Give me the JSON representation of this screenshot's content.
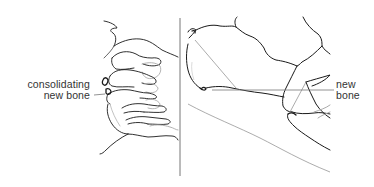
{
  "figure": {
    "panels": [
      {
        "id": "left",
        "description": "cervical spine lateral view sketch",
        "label": {
          "line1": "consolidating",
          "line2": "new bone"
        }
      },
      {
        "id": "right",
        "description": "magnified vertebral bodies sketch",
        "label": {
          "line1": "new",
          "line2": "bone"
        }
      }
    ],
    "colors": {
      "background": "#ffffff",
      "ink": "#1a1a1a",
      "leader_line": "#777777",
      "faint": "#b0b0b0",
      "label_text": "#333333"
    }
  }
}
